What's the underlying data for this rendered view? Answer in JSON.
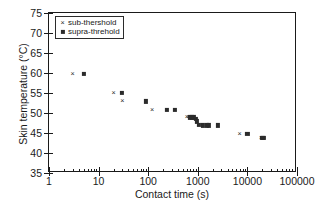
{
  "chart_data": {
    "type": "scatter",
    "title": "",
    "xlabel": "Contact time (s)",
    "ylabel": "Skin temperature (°C)",
    "xscale": "log",
    "yscale": "linear",
    "xlim": [
      1,
      100000
    ],
    "ylim": [
      35,
      75
    ],
    "xticks": [
      1,
      10,
      100,
      1000,
      10000,
      100000
    ],
    "xticklabels": [
      "1",
      "10",
      "100",
      "1000",
      "10000",
      "100000"
    ],
    "yticks": [
      35,
      40,
      45,
      50,
      55,
      60,
      65,
      70,
      75
    ],
    "yticklabels": [
      "35",
      "40",
      "45",
      "50",
      "55",
      "60",
      "65",
      "70",
      "75"
    ],
    "grid": false,
    "legend_position": "upper left",
    "marker_color": "#2b2b2b",
    "series": [
      {
        "name": "sub-thershold",
        "marker": "x",
        "points": [
          [
            3.0,
            59.8
          ],
          [
            20.0,
            54.9
          ],
          [
            30.0,
            52.9
          ],
          [
            120.0,
            50.8
          ],
          [
            600.0,
            48.9
          ],
          [
            650.0,
            48.9
          ],
          [
            7000.0,
            44.8
          ],
          [
            19000.0,
            43.8
          ]
        ]
      },
      {
        "name": "supra-threhold",
        "marker": "s",
        "points": [
          [
            5.0,
            59.8
          ],
          [
            30.0,
            55.0
          ],
          [
            90.0,
            52.9
          ],
          [
            240.0,
            50.8
          ],
          [
            350.0,
            50.8
          ],
          [
            700.0,
            48.9
          ],
          [
            760.0,
            48.9
          ],
          [
            830.0,
            48.9
          ],
          [
            900.0,
            48.6
          ],
          [
            950.0,
            47.9
          ],
          [
            1050.0,
            47.1
          ],
          [
            1250.0,
            46.9
          ],
          [
            1500.0,
            46.9
          ],
          [
            1700.0,
            46.9
          ],
          [
            2500.0,
            46.9
          ],
          [
            10000.0,
            44.8
          ],
          [
            20000.0,
            43.8
          ],
          [
            21000.0,
            43.8
          ]
        ]
      }
    ]
  },
  "legend": {
    "items": [
      {
        "label": "sub-thershold",
        "marker": "x"
      },
      {
        "label": "supra-threhold",
        "marker": "s"
      }
    ]
  }
}
